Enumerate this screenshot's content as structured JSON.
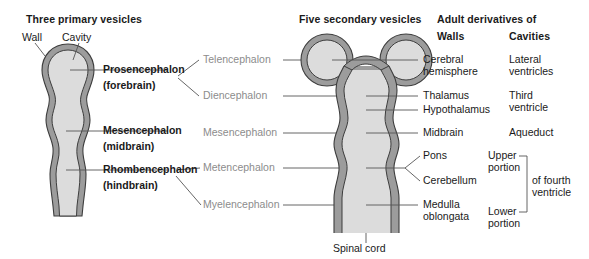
{
  "figure": {
    "title_columns": {
      "primary": "Three primary vesicles",
      "secondary": "Five secondary vesicles",
      "adult": "Adult derivatives of",
      "walls": "Walls",
      "cavities": "Cavities"
    },
    "annotations": {
      "wall": "Wall",
      "cavity": "Cavity",
      "spinal_cord": "Spinal cord"
    },
    "primary_vesicles": [
      {
        "name": "Prosencephalon",
        "common": "(forebrain)"
      },
      {
        "name": "Mesencephalon",
        "common": "(midbrain)"
      },
      {
        "name": "Rhombencephalon",
        "common": "(hindbrain)"
      }
    ],
    "secondary_vesicles": [
      "Telencephalon",
      "Diencephalon",
      "Mesencephalon",
      "Metencephalon",
      "Myelencephalon"
    ],
    "adult_walls": [
      "Cerebral hemisphere",
      "Thalamus",
      "Hypothalamus",
      "Midbrain",
      "Pons",
      "Cerebellum",
      "Medulla oblongata"
    ],
    "adult_cavities": [
      "Lateral ventricles",
      "Third ventricle",
      "Aqueduct",
      "Upper portion",
      "Lower portion"
    ],
    "cavity_bracket_label": "of fourth ventricle",
    "colors": {
      "wall_fill": "#9c9c9c",
      "cavity_fill": "#dcdcdc",
      "outline": "#4a4a4a",
      "leader_line": "#555555",
      "text": "#1a1a1a",
      "gray_text": "#8c8c8c",
      "background": "#ffffff"
    }
  }
}
